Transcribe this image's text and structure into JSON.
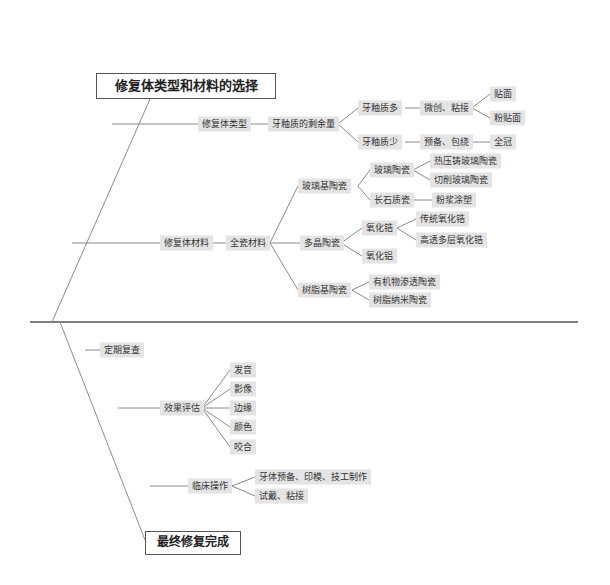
{
  "title_top": "修复体类型和材料的选择",
  "title_bottom": "最终修复完成",
  "upper": {
    "type_branch": {
      "label": "修复体类型",
      "child": "牙釉质的剩余量",
      "much": {
        "label": "牙釉质多",
        "action": "微创、粘接",
        "results": [
          "贴面",
          "粉贴面"
        ]
      },
      "little": {
        "label": "牙釉质少",
        "action": "预备、包绕",
        "result": "全冠"
      }
    },
    "material_branch": {
      "label": "修复体材料",
      "child": "全瓷材料",
      "glass": {
        "label": "玻璃基陶瓷",
        "glass_ceramic": {
          "label": "玻璃陶瓷",
          "items": [
            "热压铸玻璃陶瓷",
            "切削玻璃陶瓷"
          ]
        },
        "feldspar": {
          "label": "长石质瓷",
          "item": "粉浆涂塑"
        }
      },
      "poly": {
        "label": "多晶陶瓷",
        "zirconia": {
          "label": "氧化锆",
          "items": [
            "传统氧化锆",
            "高透多层氧化锆"
          ]
        },
        "alumina": "氧化铝"
      },
      "resin": {
        "label": "树脂基陶瓷",
        "items": [
          "有机物渗透陶瓷",
          "树脂纳米陶瓷"
        ]
      }
    }
  },
  "lower": {
    "review": "定期复查",
    "evaluation": {
      "label": "效果评估",
      "items": [
        "发音",
        "影像",
        "边缘",
        "颜色",
        "咬合"
      ]
    },
    "clinical": {
      "label": "临床操作",
      "items": [
        "牙体预备、印模、技工制作",
        "试戴、粘接"
      ]
    }
  },
  "colors": {
    "line": "#888888",
    "node_bg": "#e4e4e4",
    "main_line": "#555555"
  }
}
